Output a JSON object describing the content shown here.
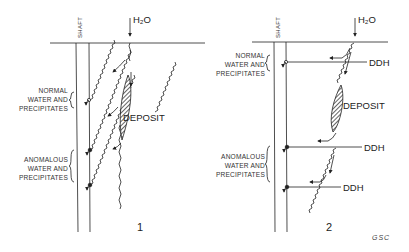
{
  "figure": {
    "credit": "GSC",
    "panels": [
      {
        "number": "1",
        "shaft_label": "SHAFT",
        "water_label": "H₂O",
        "deposit_label": "DEPOSIT",
        "normal_label": [
          "NORMAL",
          "WATER AND",
          "PRECIPITATES"
        ],
        "anomalous_label": [
          "ANOMALOUS",
          "WATER AND",
          "PRECIPITATES"
        ]
      },
      {
        "number": "2",
        "shaft_label": "SHAFT",
        "water_label": "H₂O",
        "deposit_label": "DEPOSIT",
        "normal_label": [
          "NORMAL",
          "WATER AND",
          "PRECIPITATES"
        ],
        "anomalous_label": [
          "ANOMALOUS",
          "WATER AND",
          "PRECIPITATES"
        ],
        "ddh_labels": [
          "DDH",
          "DDH",
          "DDH"
        ]
      }
    ]
  }
}
